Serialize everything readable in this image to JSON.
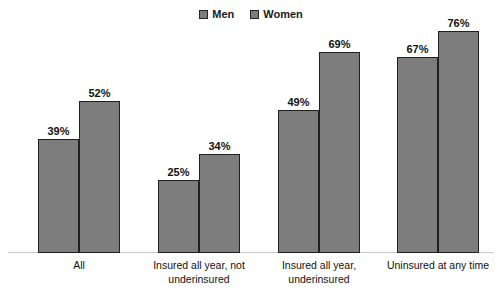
{
  "chart_data": {
    "type": "bar",
    "title": "",
    "subtitle": "",
    "xlabel": "",
    "ylabel": "",
    "ylim": [
      0,
      80
    ],
    "grid": false,
    "legend_position": "top-center",
    "categories": [
      "All",
      "Insured all year, not underinsured",
      "Insured all year, underinsured",
      "Uninsured at any time"
    ],
    "category_lines": [
      [
        "All"
      ],
      [
        "Insured all year, not",
        "underinsured"
      ],
      [
        "Insured all year,",
        "underinsured"
      ],
      [
        "Uninsured at any time"
      ]
    ],
    "series": [
      {
        "name": "Men",
        "color": "#7d7d7d",
        "values": [
          39,
          52,
          25,
          34
        ],
        "values_by_category": [
          39,
          25,
          49,
          67
        ],
        "labels_by_category": [
          "39%",
          "25%",
          "49%",
          "67%"
        ]
      },
      {
        "name": "Women",
        "color": "#7d7d7d",
        "values_by_category": [
          52,
          34,
          69,
          76
        ],
        "labels_by_category": [
          "52%",
          "34%",
          "69%",
          "76%"
        ]
      }
    ],
    "groups": [
      {
        "category_id": "all",
        "lines": [
          "All"
        ],
        "bars": [
          {
            "series": "Men",
            "value": 39,
            "label": "39%"
          },
          {
            "series": "Women",
            "value": 52,
            "label": "52%"
          }
        ]
      },
      {
        "category_id": "insured-all-year-not-underinsured",
        "lines": [
          "Insured all year, not",
          "underinsured"
        ],
        "bars": [
          {
            "series": "Men",
            "value": 25,
            "label": "25%"
          },
          {
            "series": "Women",
            "value": 34,
            "label": "34%"
          }
        ]
      },
      {
        "category_id": "insured-all-year-underinsured",
        "lines": [
          "Insured all year,",
          "underinsured"
        ],
        "bars": [
          {
            "series": "Men",
            "value": 49,
            "label": "49%"
          },
          {
            "series": "Women",
            "value": 69,
            "label": "69%"
          }
        ]
      },
      {
        "category_id": "uninsured-at-any-time",
        "lines": [
          "Uninsured at any time"
        ],
        "bars": [
          {
            "series": "Men",
            "value": 67,
            "label": "67%"
          },
          {
            "series": "Women",
            "value": 76,
            "label": "76%"
          }
        ]
      }
    ]
  },
  "legend": {
    "items": [
      {
        "label": "Men",
        "swatch": "legend-swatch-men",
        "color": "#7d7d7d"
      },
      {
        "label": "Women",
        "swatch": "legend-swatch-women",
        "color": "#7d7d7d"
      }
    ]
  },
  "colors": {
    "bar_fill": "#7d7d7d",
    "bar_border": "#1f1f1f",
    "axis_line": "#c9c9c9",
    "text": "#111111",
    "background": "#ffffff"
  }
}
